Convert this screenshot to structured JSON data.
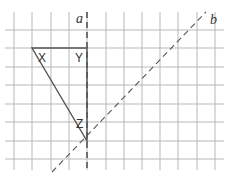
{
  "figure": {
    "grid": {
      "color": "#b8b8b8",
      "x_lines": [
        14,
        32,
        51,
        69,
        87,
        106,
        124,
        142,
        160,
        178,
        197,
        215
      ],
      "y_lines": [
        30,
        48,
        67,
        85,
        104,
        122,
        141,
        159
      ],
      "x_extent": [
        5,
        224
      ],
      "y_extent": [
        12,
        170
      ]
    },
    "lines": [
      {
        "name": "a",
        "label": "a",
        "style": "dashed",
        "x1": 87,
        "y1": 12,
        "x2": 87,
        "y2": 170,
        "label_x": 76,
        "label_y": 23
      },
      {
        "name": "b",
        "label": "b",
        "style": "dashed",
        "x1": 52,
        "y1": 172,
        "x2": 206,
        "y2": 12,
        "label_x": 210,
        "label_y": 24
      }
    ],
    "triangle": {
      "color": "#555555",
      "vertices": [
        {
          "label": "X",
          "x": 32,
          "y": 48,
          "label_x": 38,
          "label_y": 62
        },
        {
          "label": "Y",
          "x": 87,
          "y": 48,
          "label_x": 75,
          "label_y": 62
        },
        {
          "label": "Z",
          "x": 87,
          "y": 141,
          "label_x": 76,
          "label_y": 128
        }
      ]
    }
  }
}
